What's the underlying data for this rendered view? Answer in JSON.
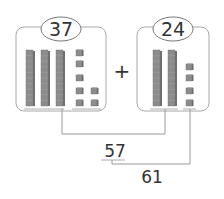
{
  "addend_a": {
    "value": "37",
    "tens": 3,
    "ones": 7
  },
  "addend_b": {
    "value": "24",
    "tens": 2,
    "ones": 4
  },
  "operator": "+",
  "step1_result": "57",
  "step2_result": "61",
  "colors": {
    "block": "#8c8c8c",
    "block_top": "#b5b5b5",
    "line": "#9a9a9a",
    "text": "#333333",
    "frame": "#a8a8a8"
  }
}
